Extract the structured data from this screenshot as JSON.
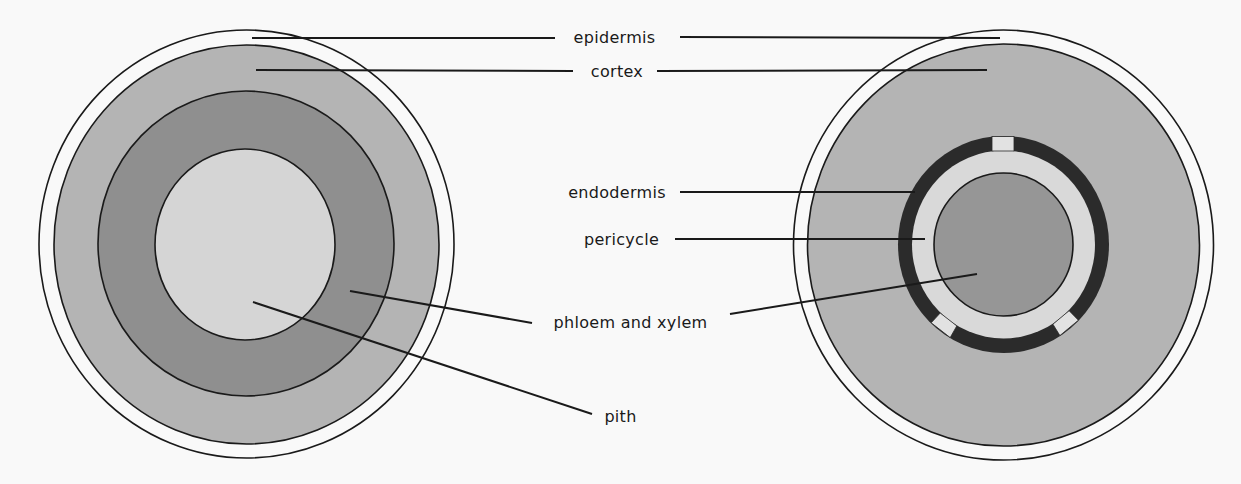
{
  "figure": {
    "background": "#f9f9f9",
    "colors": {
      "outline": "#1a1a1a",
      "epidermis": "#f9f9f9",
      "cortex": "#b4b4b4",
      "vascular_ring": "#8f8f8f",
      "pith": "#d5d5d5",
      "endodermis": "#2b2b2b",
      "pericycle": "#d9d9d9",
      "vascular_core": "#969696",
      "passage_cell": "#e2e2e2"
    },
    "left_diagram": {
      "name": "stem cross-section",
      "layers": [
        "epidermis",
        "cortex",
        "phloem and xylem",
        "pith"
      ]
    },
    "right_diagram": {
      "name": "root cross-section",
      "layers": [
        "epidermis",
        "cortex",
        "endodermis",
        "pericycle",
        "phloem and xylem"
      ]
    },
    "labels": {
      "epidermis": "epidermis",
      "cortex": "cortex",
      "endodermis": "endodermis",
      "pericycle": "pericycle",
      "phloem_xylem": "phloem and xylem",
      "pith": "pith"
    }
  }
}
